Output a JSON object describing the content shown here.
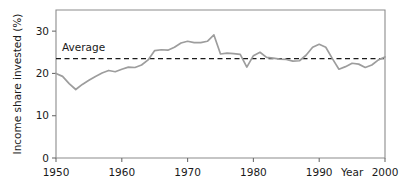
{
  "chart_data": {
    "type": "line",
    "title": "",
    "xlabel": "Year",
    "ylabel": "Income share invested (%)",
    "xlim": [
      1950,
      2000
    ],
    "ylim": [
      0,
      35
    ],
    "grid": false,
    "legend_position": "none",
    "x_ticks": [
      1950,
      1960,
      1970,
      1980,
      1990,
      2000
    ],
    "x_tick_labels": [
      "1950",
      "1960",
      "1970",
      "1980",
      "1990",
      "2000"
    ],
    "y_ticks": [
      0,
      10,
      20,
      30
    ],
    "y_tick_labels": [
      "0",
      "10",
      "20",
      "30"
    ],
    "series": [
      {
        "name": "Income share invested",
        "color": "#9d9d9d",
        "style": "solid",
        "x": [
          1950,
          1951,
          1952,
          1953,
          1954,
          1955,
          1956,
          1957,
          1958,
          1959,
          1960,
          1961,
          1962,
          1963,
          1964,
          1965,
          1966,
          1967,
          1968,
          1969,
          1970,
          1971,
          1972,
          1973,
          1974,
          1975,
          1976,
          1977,
          1978,
          1979,
          1980,
          1981,
          1982,
          1983,
          1984,
          1985,
          1986,
          1987,
          1988,
          1989,
          1990,
          1991,
          1992,
          1993,
          1994,
          1995,
          1996,
          1997,
          1998,
          1999,
          2000
        ],
        "values": [
          20.0,
          19.3,
          17.6,
          16.2,
          17.4,
          18.4,
          19.3,
          20.1,
          20.7,
          20.4,
          21.0,
          21.5,
          21.4,
          22.0,
          23.2,
          25.4,
          25.6,
          25.5,
          26.2,
          27.2,
          27.6,
          27.3,
          27.3,
          27.6,
          29.1,
          24.6,
          24.8,
          24.7,
          24.5,
          21.5,
          24.2,
          25.0,
          23.8,
          23.6,
          23.4,
          23.3,
          22.9,
          23.0,
          24.3,
          26.2,
          26.9,
          26.2,
          23.5,
          21.0,
          21.6,
          22.4,
          22.2,
          21.4,
          22.0,
          23.2,
          23.9
        ]
      }
    ],
    "annotations": [
      {
        "name": "average-line",
        "type": "hline",
        "label": "Average",
        "value": 23.5,
        "style": "dashed",
        "color": "#1a1a1a"
      }
    ]
  },
  "axes": {
    "y_title": "Income share invested (%)",
    "x_title": "Year"
  }
}
